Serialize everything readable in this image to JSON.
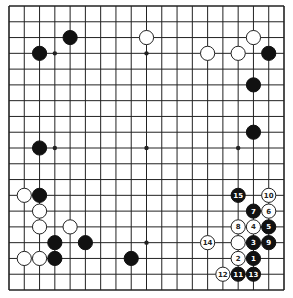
{
  "board": {
    "size": 19,
    "colors": {
      "background": "#ffffff",
      "line": "#222222",
      "black_stone": "#111111",
      "white_stone": "#ffffff",
      "white_stone_edge": "#222222",
      "black_label": "#ffffff",
      "white_label": "#222222"
    },
    "star_points": [
      [
        3,
        3
      ],
      [
        9,
        3
      ],
      [
        15,
        3
      ],
      [
        3,
        9
      ],
      [
        9,
        9
      ],
      [
        15,
        9
      ],
      [
        3,
        15
      ],
      [
        9,
        15
      ],
      [
        15,
        15
      ]
    ],
    "stones": [
      {
        "color": "black",
        "col": 4,
        "row": 2
      },
      {
        "color": "black",
        "col": 2,
        "row": 3
      },
      {
        "color": "white",
        "col": 9,
        "row": 2
      },
      {
        "color": "white",
        "col": 13,
        "row": 3
      },
      {
        "color": "white",
        "col": 15,
        "row": 3
      },
      {
        "color": "white",
        "col": 16,
        "row": 2
      },
      {
        "color": "black",
        "col": 17,
        "row": 3
      },
      {
        "color": "black",
        "col": 16,
        "row": 5
      },
      {
        "color": "black",
        "col": 16,
        "row": 8
      },
      {
        "color": "black",
        "col": 2,
        "row": 9
      },
      {
        "color": "white",
        "col": 1,
        "row": 12
      },
      {
        "color": "black",
        "col": 2,
        "row": 12
      },
      {
        "color": "white",
        "col": 2,
        "row": 13
      },
      {
        "color": "white",
        "col": 2,
        "row": 14
      },
      {
        "color": "white",
        "col": 4,
        "row": 14
      },
      {
        "color": "black",
        "col": 3,
        "row": 15
      },
      {
        "color": "black",
        "col": 5,
        "row": 15
      },
      {
        "color": "white",
        "col": 1,
        "row": 16
      },
      {
        "color": "white",
        "col": 2,
        "row": 16
      },
      {
        "color": "black",
        "col": 3,
        "row": 16
      },
      {
        "color": "black",
        "col": 8,
        "row": 16
      },
      {
        "color": "white",
        "col": 15,
        "row": 15
      },
      {
        "color": "black",
        "col": 16,
        "row": 16,
        "label": "1"
      },
      {
        "color": "white",
        "col": 15,
        "row": 16,
        "label": "2"
      },
      {
        "color": "black",
        "col": 16,
        "row": 15,
        "label": "3"
      },
      {
        "color": "white",
        "col": 16,
        "row": 14,
        "label": "4"
      },
      {
        "color": "black",
        "col": 17,
        "row": 14,
        "label": "5"
      },
      {
        "color": "white",
        "col": 17,
        "row": 13,
        "label": "6"
      },
      {
        "color": "black",
        "col": 16,
        "row": 13,
        "label": "7"
      },
      {
        "color": "white",
        "col": 15,
        "row": 14,
        "label": "8"
      },
      {
        "color": "black",
        "col": 17,
        "row": 15,
        "label": "9"
      },
      {
        "color": "white",
        "col": 17,
        "row": 12,
        "label": "10"
      },
      {
        "color": "black",
        "col": 15,
        "row": 17,
        "label": "11"
      },
      {
        "color": "white",
        "col": 14,
        "row": 17,
        "label": "12"
      },
      {
        "color": "black",
        "col": 16,
        "row": 17,
        "label": "13"
      },
      {
        "color": "white",
        "col": 13,
        "row": 15,
        "label": "14"
      },
      {
        "color": "black",
        "col": 15,
        "row": 12,
        "label": "15"
      }
    ]
  }
}
